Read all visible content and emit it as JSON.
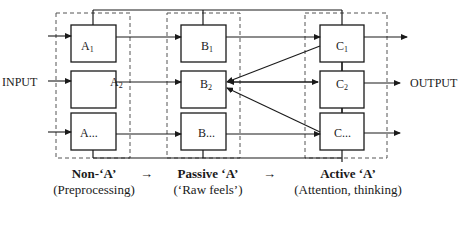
{
  "diagram": {
    "input_label": "INPUT",
    "output_label": "OUTPUT",
    "columns": [
      {
        "id": "A",
        "boxes": [
          {
            "base": "A",
            "sub": "1"
          },
          {
            "base": "A",
            "sub": "2"
          },
          {
            "base": "A...",
            "sub": ""
          }
        ],
        "stage_title": "Non-‘A’",
        "stage_subtitle": "(Preprocessing)"
      },
      {
        "id": "B",
        "boxes": [
          {
            "base": "B",
            "sub": "1"
          },
          {
            "base": "B",
            "sub": "2"
          },
          {
            "base": "B...",
            "sub": ""
          }
        ],
        "stage_title": "Passive ‘A’",
        "stage_subtitle": "(‘Raw feels’)"
      },
      {
        "id": "C",
        "boxes": [
          {
            "base": "C",
            "sub": "1"
          },
          {
            "base": "C",
            "sub": "2"
          },
          {
            "base": "C...",
            "sub": ""
          }
        ],
        "stage_title": "Active ‘A’",
        "stage_subtitle": "(Attention, thinking)"
      }
    ],
    "stage_arrows": [
      "→",
      "→"
    ],
    "colors": {
      "line": "#1a1a1a",
      "dashed_group": "#555555",
      "background": "#ffffff"
    }
  }
}
